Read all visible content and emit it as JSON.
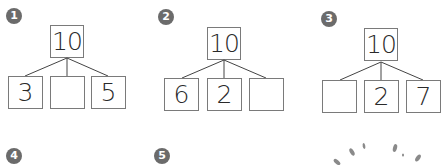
{
  "problems": [
    {
      "number": "1",
      "top": "10",
      "parts": [
        "3",
        "",
        "5"
      ]
    },
    {
      "number": "2",
      "top": "10",
      "parts": [
        "6",
        "2",
        ""
      ]
    },
    {
      "number": "3",
      "top": "10",
      "parts": [
        "",
        "2",
        "7"
      ]
    }
  ],
  "next_problems": [
    {
      "number": "4"
    },
    {
      "number": "5"
    }
  ],
  "colors": {
    "badge": "#6b6b6b",
    "border": "#7a7a7a",
    "text": "#2a2a2a"
  }
}
